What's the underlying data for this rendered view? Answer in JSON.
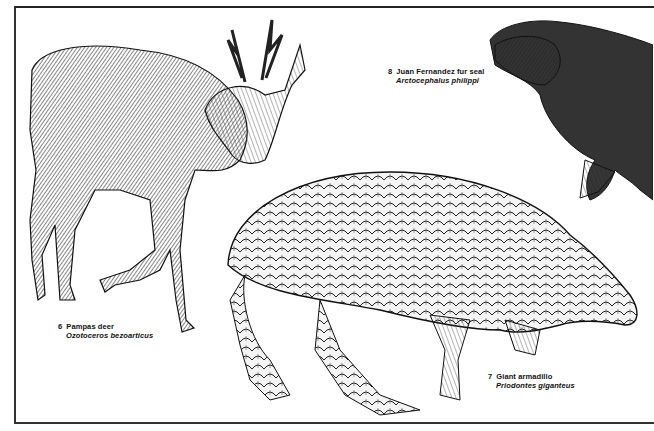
{
  "plate": {
    "animals": [
      {
        "number": "6",
        "common_name": "Pampas deer",
        "scientific_name": "Ozotoceros bezoarticus"
      },
      {
        "number": "7",
        "common_name": "Giant armadillo",
        "scientific_name": "Priodontes giganteus"
      },
      {
        "number": "8",
        "common_name": "Juan Fernandez fur seal",
        "scientific_name": "Arctocephalus philippi"
      }
    ]
  },
  "colors": {
    "ink": "#1a1a1a",
    "paper": "#ffffff",
    "border": "#2a2a2a"
  }
}
